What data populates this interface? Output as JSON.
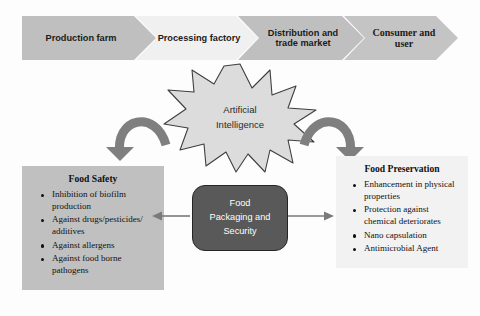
{
  "supply_chain": {
    "stages": [
      {
        "label": "Production farm",
        "fill": "#bfbfbf"
      },
      {
        "label": "Processing factory",
        "fill": "#f0f0f0"
      },
      {
        "label": "Distribution and trade market",
        "fill": "#bfbfbf"
      },
      {
        "label": "Consumer and user",
        "fill": "#c4c4c4"
      }
    ]
  },
  "ai_node": {
    "line1": "Artificial",
    "line2": "Intelligence",
    "fill": "#dcdcdc",
    "stroke": "#3f3f3f"
  },
  "center_node": {
    "line1": "Food",
    "line2": "Packaging and",
    "line3": "Security",
    "fill": "#595959",
    "text_color": "#ffffff"
  },
  "panels": {
    "food_safety": {
      "title": "Food Safety",
      "fill": "#c0c0c0",
      "items": [
        "Inhibition of biofilm production",
        "Against drugs/pesticides/ additives",
        "Against allergens",
        "Against food borne pathogens"
      ]
    },
    "food_preservation": {
      "title": "Food Preservation",
      "fill": "#f2f2f2",
      "items": [
        "Enhancement in physical properties",
        "Protection against chemical deteriorates",
        "Nano capsulation",
        "Antimicrobial Agent"
      ]
    }
  },
  "connectors": {
    "ai_to_safety": "curved-arrow-down-left",
    "ai_to_preservation": "curved-arrow-down-right",
    "center_to_safety": "arrow-left",
    "center_to_preservation": "arrow-right",
    "arrow_color": "#808080",
    "line_color": "#7a7a7a"
  }
}
